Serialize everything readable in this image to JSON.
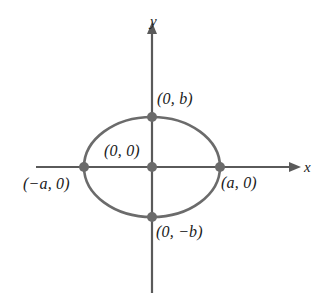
{
  "figure": {
    "kind": "ellipse-coordinate-diagram",
    "colors": {
      "curve": "#6b6b6b",
      "axis": "#5a5a5a",
      "point": "#6b6b6b",
      "text": "#1a1a1a",
      "background": "#ffffff"
    },
    "axes": {
      "x_label": "x",
      "y_label": "y",
      "x_axis": {
        "x1": 36,
        "y1": 167,
        "x2": 300,
        "y2": 167,
        "arrow": "right"
      },
      "y_axis": {
        "x1": 152,
        "y1": 293,
        "x2": 152,
        "y2": 22,
        "arrow": "up"
      }
    },
    "ellipse": {
      "center_x": 152,
      "center_y": 167,
      "semi_axis_a": 68,
      "semi_axis_b": 50
    },
    "points": [
      {
        "name": "top-vertex",
        "label": "(0, b)",
        "cx": 152,
        "cy": 117
      },
      {
        "name": "center-origin",
        "label": "(0, 0)",
        "cx": 152,
        "cy": 167
      },
      {
        "name": "left-vertex",
        "label": "(−a, 0)",
        "cx": 84,
        "cy": 167
      },
      {
        "name": "right-vertex",
        "label": "(a, 0)",
        "cx": 220,
        "cy": 167
      },
      {
        "name": "bottom-vertex",
        "label": "(0, −b)",
        "cx": 152,
        "cy": 217
      }
    ],
    "labels": {
      "top": "(0, b)",
      "center": "(0, 0)",
      "left": "(−a, 0)",
      "right": "(a, 0)",
      "bottom": "(0, −b)"
    }
  }
}
